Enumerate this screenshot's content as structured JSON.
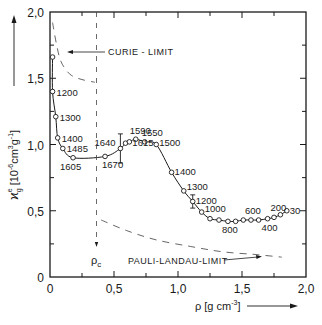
{
  "chart_data": {
    "type": "line",
    "title": "",
    "xlabel": "ρ [g cm⁻³]",
    "ylabel": "ϰ_g^e [10⁻⁶cm³g⁻¹]",
    "xlim": [
      0,
      2.0
    ],
    "ylim": [
      0,
      2.0
    ],
    "x_ticks": [
      "0",
      "0,5",
      "1,0",
      "1,5",
      "2,0"
    ],
    "y_ticks": [
      "0",
      "0,5",
      "1,0",
      "1,5",
      "2,0"
    ],
    "grid": false,
    "series": [
      {
        "name": "measured",
        "style": "solid line with open circles",
        "points": [
          {
            "x": 0.02,
            "y": 1.66,
            "label": ""
          },
          {
            "x": 0.02,
            "y": 1.4,
            "label": "1200"
          },
          {
            "x": 0.045,
            "y": 1.21,
            "label": "1300"
          },
          {
            "x": 0.06,
            "y": 1.05,
            "label": "1400"
          },
          {
            "x": 0.1,
            "y": 0.97,
            "label": "1485"
          },
          {
            "x": 0.18,
            "y": 0.9,
            "label": "1605"
          },
          {
            "x": 0.43,
            "y": 0.91,
            "label": "1670"
          },
          {
            "x": 0.55,
            "y": 0.97,
            "label": "1640",
            "error": [
              0.86,
              1.08
            ]
          },
          {
            "x": 0.59,
            "y": 1.01,
            "label": ""
          },
          {
            "x": 0.62,
            "y": 1.02,
            "label": "1615"
          },
          {
            "x": 0.67,
            "y": 1.04,
            "label": "1590"
          },
          {
            "x": 0.74,
            "y": 1.02,
            "label": "1550"
          },
          {
            "x": 0.83,
            "y": 1.0,
            "label": "1500"
          },
          {
            "x": 0.95,
            "y": 0.79,
            "label": "1400"
          },
          {
            "x": 1.045,
            "y": 0.65,
            "label": "1300"
          },
          {
            "x": 1.115,
            "y": 0.57,
            "label": "1200",
            "error": [
              0.52,
              0.62
            ]
          },
          {
            "x": 1.185,
            "y": 0.49,
            "label": "1000"
          },
          {
            "x": 1.25,
            "y": 0.44,
            "label": ""
          },
          {
            "x": 1.32,
            "y": 0.43,
            "label": ""
          },
          {
            "x": 1.39,
            "y": 0.42,
            "label": "800"
          },
          {
            "x": 1.45,
            "y": 0.42,
            "label": ""
          },
          {
            "x": 1.51,
            "y": 0.43,
            "label": ""
          },
          {
            "x": 1.57,
            "y": 0.43,
            "label": "600"
          },
          {
            "x": 1.63,
            "y": 0.43,
            "label": ""
          },
          {
            "x": 1.7,
            "y": 0.44,
            "label": "400"
          },
          {
            "x": 1.75,
            "y": 0.45,
            "label": ""
          },
          {
            "x": 1.8,
            "y": 0.47,
            "label": "200"
          },
          {
            "x": 1.85,
            "y": 0.5,
            "label": "30"
          }
        ]
      },
      {
        "name": "Curie limit",
        "style": "dashed",
        "points": [
          {
            "x": 0.02,
            "y": 1.92
          },
          {
            "x": 0.05,
            "y": 1.76
          },
          {
            "x": 0.08,
            "y": 1.64
          },
          {
            "x": 0.12,
            "y": 1.57
          },
          {
            "x": 0.17,
            "y": 1.52
          },
          {
            "x": 0.25,
            "y": 1.49
          },
          {
            "x": 0.35,
            "y": 1.47
          }
        ]
      },
      {
        "name": "Pauli-Landau limit",
        "style": "dashed",
        "points": [
          {
            "x": 0.4,
            "y": 0.43
          },
          {
            "x": 0.6,
            "y": 0.35
          },
          {
            "x": 0.83,
            "y": 0.28
          },
          {
            "x": 1.1,
            "y": 0.23
          },
          {
            "x": 1.35,
            "y": 0.19
          },
          {
            "x": 1.6,
            "y": 0.17
          },
          {
            "x": 1.81,
            "y": 0.15
          }
        ]
      }
    ],
    "critical_density": {
      "x": 0.36,
      "label": "ρc"
    },
    "annotations": [
      {
        "text": "CURIE - LIMIT",
        "arrow_to": {
          "x": 0.15,
          "y": 1.67
        }
      },
      {
        "text": "PAULI-LANDAU-LIMIT",
        "arrow_to": {
          "x": 1.63,
          "y": 0.16
        }
      }
    ]
  },
  "labels": {
    "curie": "CURIE - LIMIT",
    "pauli": "PAULI-LANDAU-LIMIT",
    "rho_c": "ρ",
    "rho_c_sub": "c",
    "x_axis": "ρ [g cm",
    "x_axis_sup": "-3",
    "x_axis_end": "]",
    "y_axis": "ϰ",
    "y_axis_sup": "e",
    "y_axis_sub": "g",
    "y_axis_unit": "[10",
    "y_axis_unit2": "-6",
    "y_axis_unit3": "cm",
    "y_axis_unit4": "3",
    "y_axis_unit5": "g",
    "y_axis_unit6": "-1",
    "y_axis_unit7": "]"
  }
}
